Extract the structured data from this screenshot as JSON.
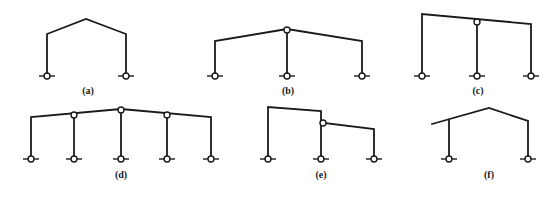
{
  "figure": {
    "line_color": "#1a1a1a",
    "background": "#ffffff",
    "panels": [
      {
        "id": "a",
        "label": "(a)",
        "description": "Single-span gabled portal frame, pinned bases",
        "label_pos": [
          88,
          94
        ],
        "members": [
          [
            [
              47,
              76
            ],
            [
              47,
              34
            ],
            [
              86,
              19
            ],
            [
              126,
              34
            ],
            [
              126,
              76
            ]
          ]
        ],
        "base_hinges": [
          [
            47,
            76
          ],
          [
            126,
            76
          ]
        ],
        "internal_hinges": []
      },
      {
        "id": "b",
        "label": "(b)",
        "description": "Two-span gabled frame with central pinned column",
        "label_pos": [
          288,
          94
        ],
        "members": [
          [
            [
              215,
              76
            ],
            [
              215,
              41
            ],
            [
              287,
              29
            ],
            [
              362,
              41
            ],
            [
              362,
              76
            ]
          ],
          [
            [
              287,
              33
            ],
            [
              287,
              76
            ]
          ]
        ],
        "base_hinges": [
          [
            215,
            76
          ],
          [
            287,
            76
          ],
          [
            362,
            76
          ]
        ],
        "internal_hinges": [
          [
            287,
            30
          ]
        ]
      },
      {
        "id": "c",
        "label": "(c)",
        "description": "Two-span mono-pitch frame with central pinned column",
        "label_pos": [
          478,
          94
        ],
        "members": [
          [
            [
              422,
              76
            ],
            [
              422,
              14
            ],
            [
              531,
              24
            ],
            [
              531,
              76
            ]
          ],
          [
            [
              477,
              23
            ],
            [
              477,
              76
            ]
          ]
        ],
        "base_hinges": [
          [
            422,
            76
          ],
          [
            477,
            76
          ],
          [
            531,
            76
          ]
        ],
        "internal_hinges": [
          [
            477,
            22
          ]
        ]
      },
      {
        "id": "d",
        "label": "(d)",
        "description": "Four-span gabled frame with pinned interior columns",
        "label_pos": [
          121,
          178
        ],
        "members": [
          [
            [
              31,
              159
            ],
            [
              31,
              117
            ],
            [
              121,
              109
            ],
            [
              211,
              117
            ],
            [
              211,
              159
            ]
          ],
          [
            [
              74,
              117
            ],
            [
              74,
              159
            ]
          ],
          [
            [
              121,
              112
            ],
            [
              121,
              159
            ]
          ],
          [
            [
              167,
              117
            ],
            [
              167,
              159
            ]
          ]
        ],
        "base_hinges": [
          [
            31,
            159
          ],
          [
            74,
            159
          ],
          [
            121,
            159
          ],
          [
            167,
            159
          ],
          [
            211,
            159
          ]
        ],
        "internal_hinges": [
          [
            74,
            115
          ],
          [
            121,
            110
          ],
          [
            167,
            115
          ]
        ]
      },
      {
        "id": "e",
        "label": "(e)",
        "description": "Stepped two-span frame, low span pinned to high column",
        "label_pos": [
          321,
          178
        ],
        "members": [
          [
            [
              268,
              159
            ],
            [
              268,
              107
            ],
            [
              321,
              111
            ],
            [
              321,
              159
            ]
          ],
          [
            [
              324,
              123
            ],
            [
              374,
              129
            ],
            [
              374,
              159
            ]
          ]
        ],
        "base_hinges": [
          [
            268,
            159
          ],
          [
            321,
            159
          ],
          [
            374,
            159
          ]
        ],
        "internal_hinges": [
          [
            323,
            123
          ]
        ]
      },
      {
        "id": "f",
        "label": "(f)",
        "description": "Gabled frame with cantilever eave overhang",
        "label_pos": [
          489,
          178
        ],
        "members": [
          [
            [
              432,
              124
            ],
            [
              489,
              108
            ],
            [
              528,
              121
            ],
            [
              528,
              159
            ]
          ],
          [
            [
              449,
              120
            ],
            [
              449,
              159
            ]
          ]
        ],
        "base_hinges": [
          [
            449,
            159
          ],
          [
            528,
            159
          ]
        ],
        "internal_hinges": []
      }
    ]
  }
}
